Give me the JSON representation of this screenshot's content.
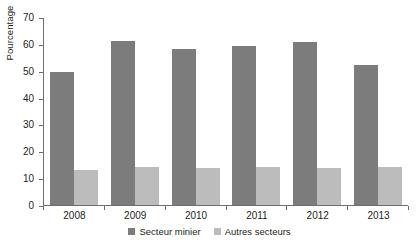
{
  "chart_data": {
    "type": "bar",
    "title": "",
    "subtitle": "",
    "xlabel": "",
    "ylabel": "Pourcentage",
    "categories": [
      "2008",
      "2009",
      "2010",
      "2011",
      "2012",
      "2013"
    ],
    "series": [
      {
        "name": "Secteur minier",
        "color": "#7c7c7c",
        "values": [
          49.5,
          61.2,
          58.2,
          59.3,
          60.8,
          52.0
        ]
      },
      {
        "name": "Autres secteurs",
        "color": "#bcbcbc",
        "values": [
          13.0,
          14.0,
          13.8,
          14.0,
          13.8,
          14.1
        ]
      }
    ],
    "ylim": [
      0,
      70
    ],
    "yticks": [
      0,
      10,
      20,
      30,
      40,
      50,
      60,
      70
    ],
    "ytick_labels": [
      "0",
      "10",
      "20",
      "30",
      "40",
      "50",
      "60",
      "70"
    ],
    "grid": false,
    "legend_position": "bottom",
    "axis_color": "#6d6e71",
    "background": "#ffffff"
  }
}
